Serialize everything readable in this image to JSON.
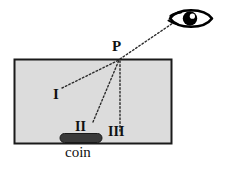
{
  "figure": {
    "tank": {
      "name": "tank-rectangle",
      "fill_color": "#dcdcdc",
      "stroke_color": "#1a1a1a",
      "x": 14,
      "y": 59,
      "width": 157,
      "height": 84
    },
    "coin": {
      "label": "coin",
      "color": "#3a3a3a",
      "x": 60,
      "y": 133,
      "width": 42,
      "height": 9
    },
    "point_P": {
      "label": "P",
      "x": 120,
      "y": 59
    },
    "eye": {
      "name": "eye-icon",
      "color": "#000000",
      "cx": 191,
      "cy": 18
    },
    "rays": [
      {
        "label": "I",
        "from_x": 62,
        "from_y": 88,
        "to_x": 120,
        "to_y": 59,
        "style": "dotted"
      },
      {
        "label": "II",
        "from_x": 93,
        "from_y": 122,
        "to_x": 120,
        "to_y": 59,
        "style": "dotted"
      },
      {
        "label": "III",
        "from_x": 120,
        "from_y": 131,
        "to_x": 120,
        "to_y": 59,
        "style": "dotted"
      },
      {
        "label": "sight-line-to-eye",
        "from_x": 120,
        "from_y": 59,
        "to_x": 173,
        "to_y": 23,
        "style": "dotted"
      }
    ]
  },
  "labels": {
    "p": "P",
    "ray_one": "I",
    "ray_two": "II",
    "ray_three": "III",
    "coin": "coin"
  }
}
